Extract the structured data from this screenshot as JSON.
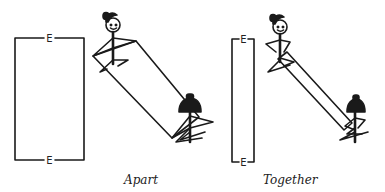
{
  "panels": [
    {
      "id": "apart",
      "caption": "Apart",
      "field_label_top": "E",
      "field_label_bottom": "E"
    },
    {
      "id": "together",
      "caption": "Together",
      "field_label_top": "E",
      "field_label_bottom": "E"
    }
  ],
  "colors": {
    "stroke": "#1a1a1a",
    "background": "#ffffff"
  }
}
